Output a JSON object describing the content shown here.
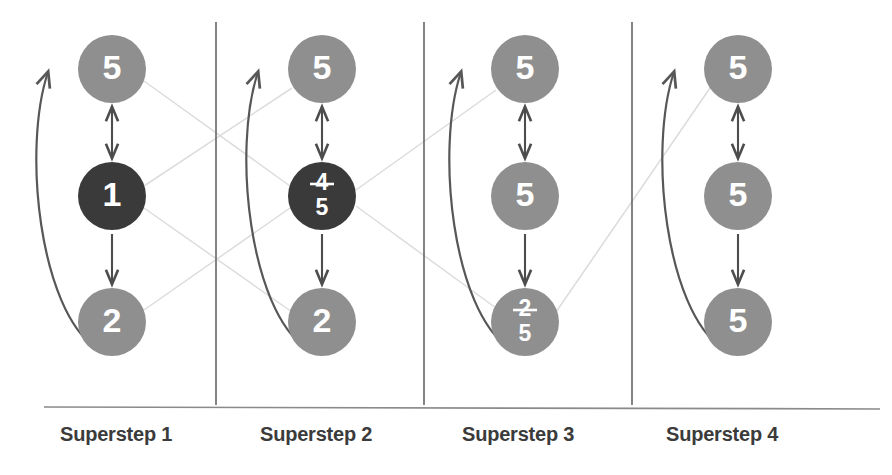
{
  "figure": {
    "background_color": "#ffffff"
  },
  "palette": {
    "node_light": "#8f8f8f",
    "node_dark": "#3a3a3a",
    "node_label": "#ffffff",
    "arrow": "#4d4d4d",
    "back_arrow": "#575757",
    "message_line": "#dcdcdc",
    "divider": "#6e6e6e",
    "baseline": "#8a8a8a",
    "label_text": "#3b3b3b"
  },
  "columns": [
    {
      "id": "superstep-1",
      "label": "Superstep 1",
      "label_x": 60,
      "label_y": 423,
      "center_x": 112,
      "divider_x": 216,
      "nodes": [
        {
          "id": "s1-top",
          "position": "top",
          "cx": 112,
          "cy": 69,
          "r": 34,
          "fill": "#8f8f8f",
          "active": false,
          "value": "5",
          "old_value": null,
          "display": "single"
        },
        {
          "id": "s1-middle",
          "position": "middle",
          "cx": 112,
          "cy": 196,
          "r": 34,
          "fill": "#3a3a3a",
          "active": true,
          "value": "1",
          "old_value": null,
          "display": "single"
        },
        {
          "id": "s1-bottom",
          "position": "bottom",
          "cx": 112,
          "cy": 322,
          "r": 34,
          "fill": "#8f8f8f",
          "active": false,
          "value": "2",
          "old_value": null,
          "display": "single"
        }
      ]
    },
    {
      "id": "superstep-2",
      "label": "Superstep 2",
      "label_x": 260,
      "label_y": 423,
      "center_x": 322,
      "divider_x": 424,
      "nodes": [
        {
          "id": "s2-top",
          "position": "top",
          "cx": 322,
          "cy": 69,
          "r": 34,
          "fill": "#8f8f8f",
          "active": false,
          "value": "5",
          "old_value": null,
          "display": "single"
        },
        {
          "id": "s2-middle",
          "position": "middle",
          "cx": 322,
          "cy": 196,
          "r": 34,
          "fill": "#3a3a3a",
          "active": true,
          "value": "5",
          "old_value": "4",
          "display": "stacked"
        },
        {
          "id": "s2-bottom",
          "position": "bottom",
          "cx": 322,
          "cy": 322,
          "r": 34,
          "fill": "#8f8f8f",
          "active": false,
          "value": "2",
          "old_value": null,
          "display": "single"
        }
      ]
    },
    {
      "id": "superstep-3",
      "label": "Superstep 3",
      "label_x": 462,
      "label_y": 423,
      "center_x": 525,
      "divider_x": 632,
      "nodes": [
        {
          "id": "s3-top",
          "position": "top",
          "cx": 525,
          "cy": 69,
          "r": 34,
          "fill": "#8f8f8f",
          "active": false,
          "value": "5",
          "old_value": null,
          "display": "single"
        },
        {
          "id": "s3-middle",
          "position": "middle",
          "cx": 525,
          "cy": 196,
          "r": 34,
          "fill": "#8f8f8f",
          "active": false,
          "value": "5",
          "old_value": null,
          "display": "single"
        },
        {
          "id": "s3-bottom",
          "position": "bottom",
          "cx": 525,
          "cy": 322,
          "r": 34,
          "fill": "#8f8f8f",
          "active": false,
          "value": "5",
          "old_value": "2",
          "display": "stacked"
        }
      ]
    },
    {
      "id": "superstep-4",
      "label": "Superstep 4",
      "label_x": 666,
      "label_y": 423,
      "center_x": 738,
      "divider_x": null,
      "nodes": [
        {
          "id": "s4-top",
          "position": "top",
          "cx": 738,
          "cy": 69,
          "r": 34,
          "fill": "#8f8f8f",
          "active": false,
          "value": "5",
          "old_value": null,
          "display": "single"
        },
        {
          "id": "s4-middle",
          "position": "middle",
          "cx": 738,
          "cy": 196,
          "r": 34,
          "fill": "#8f8f8f",
          "active": false,
          "value": "5",
          "old_value": null,
          "display": "single"
        },
        {
          "id": "s4-bottom",
          "position": "bottom",
          "cx": 738,
          "cy": 322,
          "r": 34,
          "fill": "#8f8f8f",
          "active": false,
          "value": "5",
          "old_value": null,
          "display": "single"
        }
      ]
    }
  ],
  "intra_column_arrows": [
    {
      "id": "s1-top-middle",
      "column": "superstep-1",
      "x": 112,
      "y1": 107,
      "y2": 158,
      "heads": "both"
    },
    {
      "id": "s1-middle-bottom",
      "column": "superstep-1",
      "x": 112,
      "y1": 234,
      "y2": 284,
      "heads": "end"
    },
    {
      "id": "s2-top-middle",
      "column": "superstep-2",
      "x": 322,
      "y1": 107,
      "y2": 158,
      "heads": "both"
    },
    {
      "id": "s2-middle-bottom",
      "column": "superstep-2",
      "x": 322,
      "y1": 234,
      "y2": 284,
      "heads": "end"
    },
    {
      "id": "s3-top-middle",
      "column": "superstep-3",
      "x": 525,
      "y1": 107,
      "y2": 158,
      "heads": "both"
    },
    {
      "id": "s3-middle-bottom",
      "column": "superstep-3",
      "x": 525,
      "y1": 234,
      "y2": 284,
      "heads": "end"
    },
    {
      "id": "s4-top-middle",
      "column": "superstep-4",
      "x": 738,
      "y1": 107,
      "y2": 158,
      "heads": "both"
    },
    {
      "id": "s4-middle-bottom",
      "column": "superstep-4",
      "x": 738,
      "y1": 234,
      "y2": 284,
      "heads": "end"
    }
  ],
  "back_arrows": [
    {
      "id": "s1-back",
      "column": "superstep-1",
      "path": "M 96 348 C 40 310, 22 150, 48 72",
      "arrow_at": "top"
    },
    {
      "id": "s2-back",
      "column": "superstep-2",
      "path": "M 306 348 C 250 310, 232 150, 258 72",
      "arrow_at": "top"
    },
    {
      "id": "s3-back",
      "column": "superstep-3",
      "path": "M 509 348 C 453 310, 435 150, 461 72",
      "arrow_at": "top"
    },
    {
      "id": "s4-back",
      "column": "superstep-4",
      "path": "M 722 348 C 666 310, 648 150, 674 72",
      "arrow_at": "top"
    }
  ],
  "message_lines": [
    {
      "id": "msg-s1top-to-s2middle",
      "from": "s1-top",
      "to": "s2-middle",
      "x1": 144,
      "y1": 81,
      "x2": 290,
      "y2": 186
    },
    {
      "id": "msg-s1middle-to-s2top",
      "from": "s1-middle",
      "to": "s2-top",
      "x1": 144,
      "y1": 186,
      "x2": 292,
      "y2": 88
    },
    {
      "id": "msg-s1middle-to-s2bottom",
      "from": "s1-middle",
      "to": "s2-bottom",
      "x1": 144,
      "y1": 208,
      "x2": 292,
      "y2": 312
    },
    {
      "id": "msg-s1bottom-to-s2middle",
      "from": "s1-bottom",
      "to": "s2-middle",
      "x1": 144,
      "y1": 310,
      "x2": 290,
      "y2": 208
    },
    {
      "id": "msg-s2middle-to-s3top",
      "from": "s2-middle",
      "to": "s3-top",
      "x1": 356,
      "y1": 190,
      "x2": 496,
      "y2": 90
    },
    {
      "id": "msg-s2middle-to-s3bottom",
      "from": "s2-middle",
      "to": "s3-bottom",
      "x1": 356,
      "y1": 206,
      "x2": 496,
      "y2": 308
    },
    {
      "id": "msg-s3bottom-to-s4top",
      "from": "s3-bottom",
      "to": "s4-top",
      "x1": 556,
      "y1": 312,
      "x2": 710,
      "y2": 88
    }
  ],
  "baseline": {
    "y": 407,
    "x1": 44,
    "x2": 880
  },
  "divider_top_y": 22,
  "divider_bottom_y": 405
}
